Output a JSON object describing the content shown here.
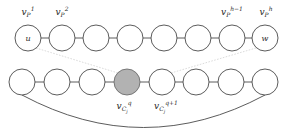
{
  "figure": {
    "background_color": "#ffffff",
    "node_stroke_color": "#4a4a4a",
    "node_fill_color": "#ffffff",
    "shaded_node_fill_color": "#b2b2b2",
    "shaded_node_stroke_color": "#6d6d6d",
    "cross_link_color": "#cfcfcf",
    "text_color": "#1f1f1f"
  },
  "top_row": {
    "name": "path-row",
    "node_count": 8,
    "node_radius": 13,
    "center_y": 38,
    "centers_x": [
      28,
      62,
      96,
      130,
      164,
      198,
      232,
      265
    ],
    "nodes": [
      {
        "inner_label": "u",
        "label": "v",
        "label_sub": "P",
        "label_sup": "1",
        "shaded": false
      },
      {
        "inner_label": "",
        "label": "v",
        "label_sub": "P",
        "label_sup": "2",
        "shaded": false
      },
      {
        "inner_label": "",
        "label": "",
        "label_sub": "",
        "label_sup": "",
        "shaded": false
      },
      {
        "inner_label": "",
        "label": "",
        "label_sub": "",
        "label_sup": "",
        "shaded": false
      },
      {
        "inner_label": "",
        "label": "",
        "label_sub": "",
        "label_sup": "",
        "shaded": false
      },
      {
        "inner_label": "",
        "label": "",
        "label_sub": "",
        "label_sup": "",
        "shaded": false
      },
      {
        "inner_label": "",
        "label": "v",
        "label_sub": "P",
        "label_sup": "h-1",
        "shaded": false
      },
      {
        "inner_label": "w",
        "label": "v",
        "label_sub": "P",
        "label_sup": "h",
        "shaded": false
      }
    ],
    "labels": [
      {
        "index": 0,
        "base": "v",
        "sub": "P",
        "sup": "1",
        "x": 28,
        "y": 15
      },
      {
        "index": 1,
        "base": "v",
        "sub": "P",
        "sup": "2",
        "x": 62,
        "y": 15
      },
      {
        "index": 6,
        "base": "v",
        "sub": "P",
        "sup": "h−1",
        "x": 232,
        "y": 15
      },
      {
        "index": 7,
        "base": "v",
        "sub": "P",
        "sup": "h",
        "x": 266,
        "y": 15
      }
    ]
  },
  "bottom_row": {
    "name": "cycle-row",
    "node_count": 8,
    "node_radius": 13,
    "center_y": 82,
    "centers_x": [
      22,
      57,
      92,
      127,
      162,
      196,
      231,
      265
    ],
    "shaded_index": 3,
    "nodes": [
      {
        "inner_label": "",
        "shaded": false
      },
      {
        "inner_label": "",
        "shaded": false
      },
      {
        "inner_label": "",
        "shaded": false
      },
      {
        "inner_label": "",
        "shaded": true
      },
      {
        "inner_label": "",
        "shaded": false
      },
      {
        "inner_label": "",
        "shaded": false
      },
      {
        "inner_label": "",
        "shaded": false
      },
      {
        "inner_label": "",
        "shaded": false
      }
    ],
    "labels": [
      {
        "index": 3,
        "base": "v",
        "sub": "C",
        "subsub": "j",
        "sup": "q",
        "x": 124,
        "y": 111
      },
      {
        "index": 4,
        "base": "v",
        "sub": "C",
        "subsub": "j",
        "sup": "q+1",
        "x": 166,
        "y": 111
      }
    ],
    "arc": {
      "name": "cycle-closing-arc",
      "from_index": 0,
      "to_index": 7,
      "dip_y": 125
    }
  },
  "cross_links": [
    {
      "name": "cross-link-u-to-vq",
      "from": "top-node-1",
      "to": "bottom-node-4",
      "style": "dashed-light"
    },
    {
      "name": "cross-link-vq1-to-w",
      "from": "bottom-node-5",
      "to": "top-node-8",
      "style": "dashed-light"
    }
  ]
}
